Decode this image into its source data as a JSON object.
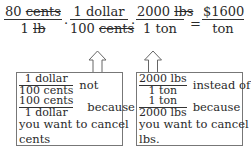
{
  "equation": {
    "fractions": [
      {
        "numerator": "80",
        "numerator_unit": "cents",
        "denominator": "1",
        "denominator_unit": "lb",
        "struck": [
          "numerator_unit",
          "denominator_unit"
        ]
      },
      {
        "numerator": "1",
        "numerator_unit": "dollar",
        "denominator": "100",
        "denominator_unit": "cents",
        "struck": [
          "denominator_unit"
        ]
      },
      {
        "numerator": "2000",
        "numerator_unit": "lbs",
        "denominator": "1",
        "denominator_unit": "ton",
        "struck": [
          "numerator_unit"
        ]
      }
    ],
    "operators": [
      "·",
      "·",
      "="
    ],
    "result": {
      "numerator": "$1600",
      "denominator": "ton"
    }
  },
  "notes": [
    {
      "correct_fraction": {
        "numerator": "1 dollar",
        "denominator": "100 cents"
      },
      "connector1": "not",
      "wrong_fraction": {
        "numerator": "100 cents",
        "denominator": "1 dollar"
      },
      "connector2": "because",
      "explanation_line1": "you want to cancel",
      "explanation_line2": "cents"
    },
    {
      "correct_fraction": {
        "numerator": "2000 lbs",
        "denominator": "1 ton"
      },
      "connector1": "instead of",
      "wrong_fraction": {
        "numerator": "1 ton",
        "denominator": "2000 lbs"
      },
      "connector2": "because",
      "explanation_line1": "you want to cancel",
      "explanation_line2": "lbs."
    }
  ]
}
